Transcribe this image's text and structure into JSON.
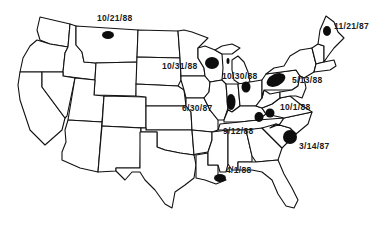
{
  "map": {
    "region": "Contiguous United States",
    "style": "black-and-white state outline map",
    "outbreaks": [
      {
        "id": "montana",
        "label": "10/21/88",
        "blob": {
          "cx": 108,
          "cy": 35,
          "rx": 6,
          "ry": 4
        },
        "label_pos": {
          "x": 97,
          "y": 18
        }
      },
      {
        "id": "wisconsin",
        "label": "10/31/88",
        "blob": {
          "cx": 212,
          "cy": 63,
          "rx": 7,
          "ry": 6
        },
        "label_pos": {
          "x": 162,
          "y": 62
        }
      },
      {
        "id": "michigan-upper",
        "label": "10/30/88",
        "blob": {
          "cx": 228,
          "cy": 61,
          "rx": 1.5,
          "ry": 3
        },
        "label_pos": {
          "x": 222,
          "y": 72
        }
      },
      {
        "id": "indiana-ohio",
        "label": "",
        "blob": {
          "cx": 246,
          "cy": 87,
          "rx": 4.5,
          "ry": 5.5
        },
        "label_pos": null
      },
      {
        "id": "pennsylvania",
        "label": "5/13/88",
        "blob": {
          "cx": 276,
          "cy": 80,
          "rx": 10,
          "ry": 6
        },
        "label_pos": {
          "x": 292,
          "y": 76
        }
      },
      {
        "id": "maine",
        "label": "11/21/87",
        "blob": {
          "cx": 327,
          "cy": 31,
          "rx": 4,
          "ry": 5
        },
        "label_pos": {
          "x": 334,
          "y": 24
        }
      },
      {
        "id": "illinois",
        "label": "6/30/87",
        "blob": {
          "cx": 231,
          "cy": 102,
          "rx": 4.5,
          "ry": 8
        },
        "label_pos": {
          "x": 182,
          "y": 106
        }
      },
      {
        "id": "kentucky-west",
        "label": "",
        "blob": {
          "cx": 259,
          "cy": 117,
          "rx": 4.5,
          "ry": 5
        },
        "label_pos": null
      },
      {
        "id": "west-virginia",
        "label": "10/1/88",
        "blob": {
          "cx": 270,
          "cy": 113,
          "rx": 4.5,
          "ry": 4.5
        },
        "label_pos": {
          "x": 280,
          "y": 104
        }
      },
      {
        "id": "tennessee",
        "label": "9/12/88",
        "blob": null,
        "label_pos": {
          "x": 223,
          "y": 127
        }
      },
      {
        "id": "south-carolina",
        "label": "3/14/87",
        "blob": {
          "cx": 290,
          "cy": 137,
          "rx": 7,
          "ry": 7
        },
        "label_pos": {
          "x": 299,
          "y": 142
        }
      },
      {
        "id": "louisiana",
        "label": "4/1/88",
        "blob": {
          "cx": 220,
          "cy": 178,
          "rx": 6,
          "ry": 4
        },
        "label_pos": {
          "x": 226,
          "y": 167
        }
      }
    ]
  }
}
